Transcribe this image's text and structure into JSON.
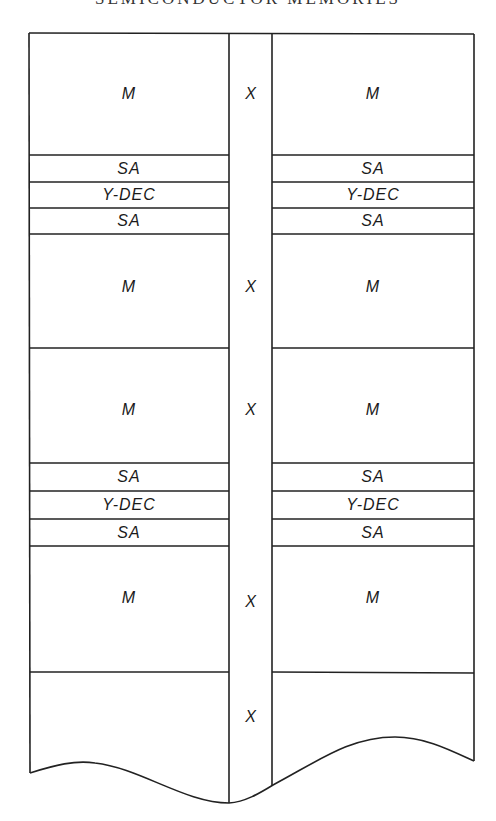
{
  "header": {
    "title": "SEMICONDUCTOR MEMORIES"
  },
  "diagram": {
    "columns": [
      "left-array",
      "x-decoder-strip",
      "right-array"
    ],
    "rows": [
      {
        "left": "M",
        "center": "X",
        "right": "M"
      },
      {
        "left": "SA",
        "center": "",
        "right": "SA"
      },
      {
        "left": "Y-DEC",
        "center": "",
        "right": "Y-DEC"
      },
      {
        "left": "SA",
        "center": "",
        "right": "SA"
      },
      {
        "left": "M",
        "center": "X",
        "right": "M"
      },
      {
        "left": "M",
        "center": "X",
        "right": "M"
      },
      {
        "left": "SA",
        "center": "",
        "right": "SA"
      },
      {
        "left": "Y-DEC",
        "center": "",
        "right": "Y-DEC"
      },
      {
        "left": "SA",
        "center": "",
        "right": "SA"
      },
      {
        "left": "M",
        "center": "X",
        "right": "M"
      },
      {
        "left": "",
        "center": "X",
        "right": ""
      }
    ]
  }
}
